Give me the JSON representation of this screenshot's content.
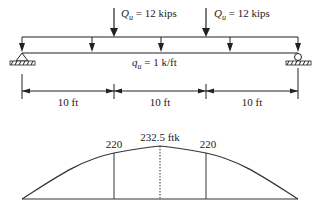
{
  "loads": {
    "point_load_1": {
      "symbol": "Q",
      "subscript": "u",
      "text": " = 12 kips"
    },
    "point_load_2": {
      "symbol": "Q",
      "subscript": "u",
      "text": " = 12 kips"
    },
    "distributed_load": {
      "symbol": "q",
      "subscript": "u",
      "text": " = 1 k/ft"
    }
  },
  "dimensions": {
    "span_1": "10 ft",
    "span_2": "10 ft",
    "span_3": "10 ft"
  },
  "moment_diagram": {
    "left_value": "220",
    "peak_value": "232.5 ftk",
    "right_value": "220"
  },
  "supports": {
    "left": "pin-support-icon",
    "right": "roller-support-icon"
  },
  "colors": {
    "line": "#222222",
    "background": "#ffffff"
  }
}
